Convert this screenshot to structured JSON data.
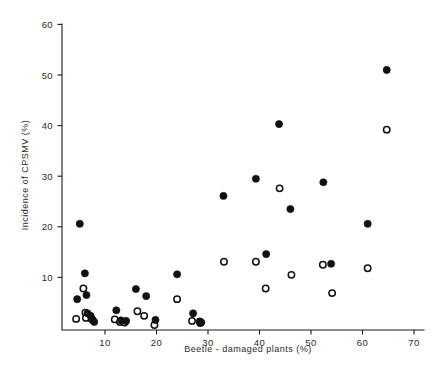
{
  "chart_data": {
    "type": "scatter",
    "title": "",
    "xlabel": "Beetle - damaged plants  (%)",
    "ylabel": "Incidence  of  CPSMV  (%)",
    "xlim": [
      0,
      70
    ],
    "ylim": [
      0,
      60
    ],
    "xticks": [
      10,
      20,
      30,
      40,
      50,
      60,
      70
    ],
    "yticks": [
      10,
      20,
      30,
      40,
      50,
      60
    ],
    "xtick_labels": [
      "10",
      "20",
      "30",
      "40",
      "50",
      "60",
      "70"
    ],
    "ytick_labels": [
      "10",
      "20",
      "30",
      "40",
      "50",
      "60"
    ],
    "grid": false,
    "legend": null,
    "series": [
      {
        "name": "filled-circles",
        "marker": "filled-circle",
        "color": "#111111",
        "points": [
          {
            "x": 4.6,
            "y": 5.7
          },
          {
            "x": 5.1,
            "y": 20.6
          },
          {
            "x": 6.1,
            "y": 10.8
          },
          {
            "x": 6.4,
            "y": 6.5
          },
          {
            "x": 6.6,
            "y": 2.9
          },
          {
            "x": 7.2,
            "y": 2.4
          },
          {
            "x": 7.6,
            "y": 1.6
          },
          {
            "x": 7.9,
            "y": 1.2
          },
          {
            "x": 12.2,
            "y": 3.5
          },
          {
            "x": 13.1,
            "y": 1.5
          },
          {
            "x": 14.1,
            "y": 1.4
          },
          {
            "x": 16.0,
            "y": 7.7
          },
          {
            "x": 18.0,
            "y": 6.3
          },
          {
            "x": 19.8,
            "y": 1.6
          },
          {
            "x": 24.0,
            "y": 10.6
          },
          {
            "x": 27.1,
            "y": 2.9
          },
          {
            "x": 28.4,
            "y": 1.3
          },
          {
            "x": 28.7,
            "y": 1.1
          },
          {
            "x": 33.0,
            "y": 26.1
          },
          {
            "x": 39.3,
            "y": 29.5
          },
          {
            "x": 41.3,
            "y": 14.6
          },
          {
            "x": 43.8,
            "y": 40.3
          },
          {
            "x": 46.0,
            "y": 23.5
          },
          {
            "x": 52.4,
            "y": 28.8
          },
          {
            "x": 53.9,
            "y": 12.7
          },
          {
            "x": 61.0,
            "y": 20.6
          },
          {
            "x": 64.7,
            "y": 51.0
          }
        ]
      },
      {
        "name": "open-circles",
        "marker": "open-circle",
        "color": "#ffffff",
        "points": [
          {
            "x": 4.4,
            "y": 1.8
          },
          {
            "x": 5.8,
            "y": 7.8
          },
          {
            "x": 6.2,
            "y": 3.0
          },
          {
            "x": 6.3,
            "y": 2.0
          },
          {
            "x": 7.4,
            "y": 1.8
          },
          {
            "x": 11.9,
            "y": 1.7
          },
          {
            "x": 12.9,
            "y": 1.2
          },
          {
            "x": 13.8,
            "y": 1.1
          },
          {
            "x": 16.3,
            "y": 3.3
          },
          {
            "x": 17.6,
            "y": 2.4
          },
          {
            "x": 19.6,
            "y": 0.6
          },
          {
            "x": 24.0,
            "y": 5.7
          },
          {
            "x": 26.9,
            "y": 1.4
          },
          {
            "x": 28.5,
            "y": 1.0
          },
          {
            "x": 33.1,
            "y": 13.1
          },
          {
            "x": 39.3,
            "y": 13.1
          },
          {
            "x": 41.2,
            "y": 7.8
          },
          {
            "x": 43.9,
            "y": 27.6
          },
          {
            "x": 46.2,
            "y": 10.5
          },
          {
            "x": 52.3,
            "y": 12.5
          },
          {
            "x": 54.1,
            "y": 6.9
          },
          {
            "x": 61.0,
            "y": 11.8
          },
          {
            "x": 64.7,
            "y": 39.2
          }
        ]
      }
    ]
  },
  "figure": {
    "axis_color": "#1a1a1a",
    "background": "#ffffff"
  }
}
